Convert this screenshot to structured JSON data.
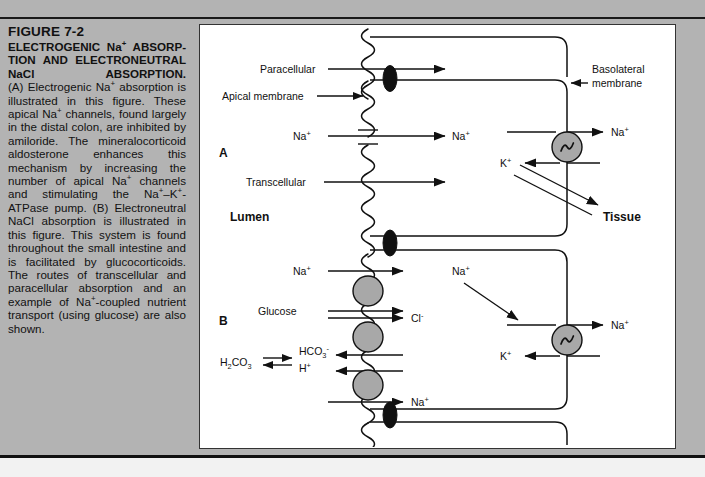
{
  "figure": {
    "number": "FIGURE 7-2",
    "title_bold": "ELECTROGENIC Na+ ABSORPTION AND ELECTRONEUTRAL NaCl ABSORPTION.",
    "caption_text": "(A) Electrogenic Na+ absorption is illustrated in this figure. These apical Na+ channels, found largely in the distal colon, are inhibited by amiloride. The mineralocorticoid aldosterone enhances this mechanism by increasing the number of apical Na+ channels and stimulating the Na+-K+-ATPase pump. (B) Electroneutral NaCl absorption is illustrated in this figure. This system is found throughout the small intestine and is facilitated by glucocorticoids. The routes of transcellular and paracellular absorption and an example of Na+-coupled nutrient transport (using glucose) are also shown."
  },
  "diagram": {
    "panel_a_label": "A",
    "panel_b_label": "B",
    "lumen_label": "Lumen",
    "tissue_label": "Tissue",
    "labels": {
      "paracellular": "Paracellular",
      "apical_membrane": "Apical membrane",
      "basolateral_membrane_line1": "Basolateral",
      "basolateral_membrane_line2": "membrane",
      "transcellular": "Transcellular",
      "glucose": "Glucose"
    },
    "ions": {
      "sodium": "Na",
      "potassium": "K",
      "chloride": "Cl",
      "plus": "+",
      "minus": "-"
    },
    "reaction": {
      "left": "H2CO3",
      "arrow": "equilibrium",
      "right_top": "HCO3-",
      "right_bottom": "H+"
    },
    "panel_a_ions": {
      "apical_na": "Na+",
      "cell_na": "Na+",
      "pump_na_out": "Na+",
      "pump_k_in": "K+"
    },
    "panel_b_ions": {
      "apical_na": "Na+",
      "glucose": "Glucose",
      "chloride_out": "Cl-",
      "apical_na_bottom": "Na+",
      "cell_na": "Na+",
      "pump_na_out": "Na+",
      "pump_k_in": "K+"
    }
  },
  "colors": {
    "page_background": "#b3b3b3",
    "figure_background": "#ffffff",
    "ink": "#111111",
    "pump_fill": "#a8a8a8",
    "tight_junction": "#111111"
  }
}
